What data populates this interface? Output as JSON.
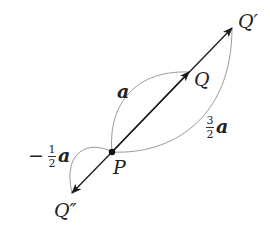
{
  "diagram": {
    "title": "",
    "points": {
      "P": {
        "label": "P",
        "x": 112,
        "y": 152
      },
      "Q": {
        "label": "Q",
        "x": 189,
        "y": 72
      },
      "Q_prime": {
        "label": "Q′",
        "x": 232,
        "y": 28
      },
      "Q_double_prime": {
        "label": "Q″",
        "x": 72,
        "y": 193
      }
    },
    "vectors": [
      {
        "from": "P",
        "to": "Q",
        "label": "a",
        "coefficient": "1"
      },
      {
        "from": "P",
        "to": "Q′",
        "label": "a",
        "coefficient": "3/2"
      },
      {
        "from": "P",
        "to": "Q″",
        "label": "a",
        "coefficient": "−1/2"
      }
    ],
    "labels": {
      "a": {
        "vector": "a"
      },
      "three_halves": {
        "num": "3",
        "den": "2",
        "vector": "a"
      },
      "neg_half": {
        "sign": "−",
        "num": "1",
        "den": "2",
        "vector": "a"
      }
    },
    "colors": {
      "arrow": "#1a1a1a",
      "brace_curve": "#9a9a9a",
      "text": "#222222",
      "background": "#ffffff"
    }
  }
}
